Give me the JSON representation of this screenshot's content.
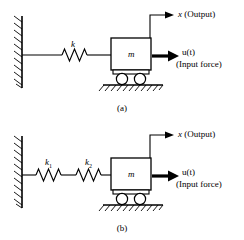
{
  "figure": {
    "stroke_color": "#000000",
    "background_color": "#ffffff"
  },
  "panel_a": {
    "caption": "(a)",
    "spring_label": "k",
    "mass_label": "m",
    "output_var": "x",
    "output_note": "(Output)",
    "input_var": "u(t)",
    "input_note": "(Input force)"
  },
  "panel_b": {
    "caption": "(b)",
    "spring1_label": "k",
    "spring1_sub": "1",
    "spring2_label": "k",
    "spring2_sub": "2",
    "mass_label": "m",
    "output_var": "x",
    "output_note": "(Output)",
    "input_var": "u(t)",
    "input_note": "(Input force)"
  }
}
